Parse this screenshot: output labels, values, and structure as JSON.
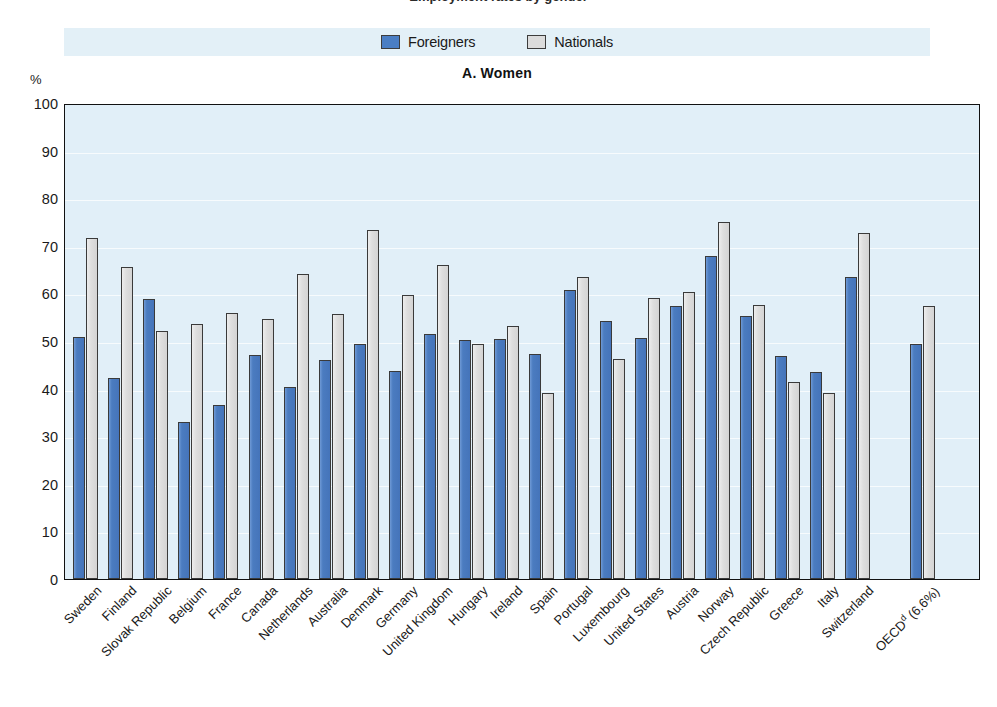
{
  "figure": {
    "clipped_title": "Employment rates by gender",
    "unit_label": "%",
    "panel_title": "A.  Women"
  },
  "legend": {
    "items": [
      {
        "label": "Foreigners",
        "color": "#4a7ec4",
        "swatch": "foreigners"
      },
      {
        "label": "Nationals",
        "color": "#dcdcdc",
        "swatch": "nationals"
      }
    ]
  },
  "chart_data": {
    "type": "bar",
    "title": "A.  Women",
    "xlabel": "",
    "ylabel": "%",
    "ylim": [
      0,
      100
    ],
    "yticks": [
      0,
      10,
      20,
      30,
      40,
      50,
      60,
      70,
      80,
      90,
      100
    ],
    "grid": true,
    "legend_position": "top-center",
    "categories": [
      "Sweden",
      "Finland",
      "Slovak Republic",
      "Belgium",
      "France",
      "Canada",
      "Netherlands",
      "Australia",
      "Denmark",
      "Germany",
      "United Kingdom",
      "Hungary",
      "Ireland",
      "Spain",
      "Portugal",
      "Luxembourg",
      "United States",
      "Austria",
      "Norway",
      "Czech Republic",
      "Greece",
      "Italy",
      "Switzerland",
      "OECD<sup>d</sup> (6.6%)"
    ],
    "series": [
      {
        "name": "Foreigners",
        "color": "#4a7ec4",
        "values": [
          50.9,
          42.2,
          58.8,
          33.0,
          36.6,
          47.0,
          40.3,
          46.0,
          49.4,
          43.7,
          51.5,
          50.3,
          50.4,
          47.2,
          60.8,
          54.1,
          50.6,
          57.3,
          67.9,
          55.3,
          46.8,
          43.4,
          63.4,
          49.4
        ]
      },
      {
        "name": "Nationals",
        "color": "#dcdcdc",
        "values": [
          71.6,
          65.6,
          52.0,
          53.5,
          55.8,
          54.6,
          64.1,
          55.6,
          73.3,
          59.6,
          66.0,
          49.4,
          53.1,
          39.0,
          63.4,
          46.2,
          59.0,
          60.3,
          75.1,
          57.5,
          41.4,
          39.1,
          72.7,
          57.4
        ]
      }
    ],
    "gap_before_index": 23
  }
}
